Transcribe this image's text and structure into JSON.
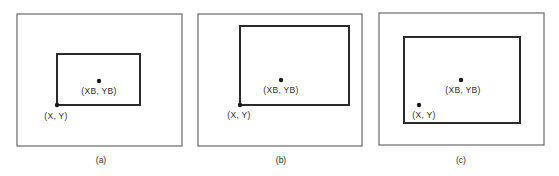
{
  "colors": {
    "background": "#ffffff",
    "outer_frame": "#6a6a6a",
    "inner_rect": "#2a2a2a",
    "dot": "#1a1a1a",
    "text": "#2a2a2a"
  },
  "panels": [
    {
      "caption": "(a)",
      "outer": {
        "x": 17,
        "y": 14,
        "w": 165,
        "h": 132
      },
      "inner": {
        "x": 57,
        "y": 54,
        "w": 83,
        "h": 51
      },
      "center_dot": {
        "x": 99,
        "y": 81
      },
      "center_label": "(XB, YB)",
      "center_label_pos": {
        "x": 99,
        "y": 94
      },
      "corner_dot": {
        "x": 57,
        "y": 105
      },
      "corner_label": "(X, Y)",
      "corner_label_pos": {
        "x": 56,
        "y": 119
      },
      "caption_pos": {
        "x": 101,
        "y": 163
      }
    },
    {
      "caption": "(b)",
      "outer": {
        "x": 198,
        "y": 14,
        "w": 164,
        "h": 132
      },
      "inner": {
        "x": 240,
        "y": 26,
        "w": 109,
        "h": 79
      },
      "center_dot": {
        "x": 281,
        "y": 80
      },
      "center_label": "(XB, YB)",
      "center_label_pos": {
        "x": 281,
        "y": 93
      },
      "corner_dot": {
        "x": 240,
        "y": 105
      },
      "corner_label": "(X, Y)",
      "corner_label_pos": {
        "x": 239,
        "y": 118
      },
      "caption_pos": {
        "x": 281,
        "y": 163
      }
    },
    {
      "caption": "(c)",
      "outer": {
        "x": 379,
        "y": 13,
        "w": 165,
        "h": 132
      },
      "inner": {
        "x": 404,
        "y": 37,
        "w": 116,
        "h": 86
      },
      "center_dot": {
        "x": 461,
        "y": 80
      },
      "center_label": "(XB, YB)",
      "center_label_pos": {
        "x": 463,
        "y": 93
      },
      "corner_dot": {
        "x": 419,
        "y": 105
      },
      "corner_label": "(X, Y)",
      "corner_label_pos": {
        "x": 424,
        "y": 118
      },
      "caption_pos": {
        "x": 461,
        "y": 163
      }
    }
  ]
}
